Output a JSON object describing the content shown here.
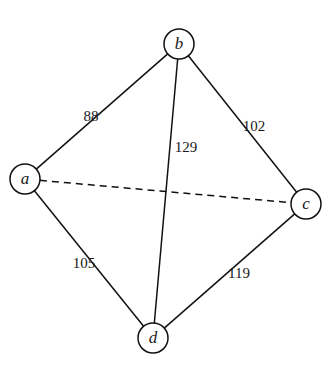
{
  "graph": {
    "nodes": [
      {
        "id": "a",
        "label": "a",
        "x": 25,
        "y": 179
      },
      {
        "id": "b",
        "label": "b",
        "x": 179,
        "y": 44
      },
      {
        "id": "c",
        "label": "c",
        "x": 306,
        "y": 204
      },
      {
        "id": "d",
        "label": "d",
        "x": 153,
        "y": 338
      }
    ],
    "edges": [
      {
        "from": "a",
        "to": "b",
        "weight": "88",
        "style": "solid",
        "label_x": 91,
        "label_y": 121
      },
      {
        "from": "b",
        "to": "d",
        "weight": "129",
        "style": "solid",
        "label_x": 186,
        "label_y": 152
      },
      {
        "from": "b",
        "to": "c",
        "weight": "102",
        "style": "solid",
        "label_x": 254,
        "label_y": 131
      },
      {
        "from": "a",
        "to": "d",
        "weight": "105",
        "style": "solid",
        "label_x": 84,
        "label_y": 268
      },
      {
        "from": "d",
        "to": "c",
        "weight": "119",
        "style": "solid",
        "label_x": 239,
        "label_y": 278
      },
      {
        "from": "a",
        "to": "c",
        "weight": "",
        "style": "dashed"
      }
    ]
  },
  "colors": {
    "stroke": "#111111",
    "background": "#ffffff"
  }
}
